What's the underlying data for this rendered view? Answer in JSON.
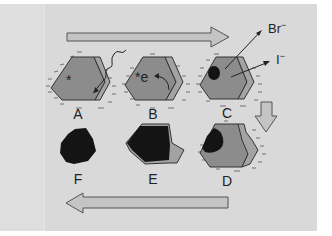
{
  "colors": {
    "background": "#d9d9d9",
    "panel_edge": "#e6e6e6",
    "crystal_face": "#8c8c8c",
    "crystal_side": "#a3a3a3",
    "crystal_stroke": "#333333",
    "arrow_fill": "#c4c4c4",
    "arrow_stroke": "#555555",
    "dark_deposit": "#141414",
    "charge_marks": "#555555"
  },
  "stages": [
    {
      "id": "A",
      "label": "A",
      "marks": [
        "*"
      ],
      "description": "crystal with incoming photon (wavy arrow)"
    },
    {
      "id": "B",
      "label": "B",
      "marks": [
        "*e"
      ],
      "description": "electron released from excited site"
    },
    {
      "id": "C",
      "label": "C",
      "marks": [],
      "description": "dark speck forms, Br- and I- ions leave"
    },
    {
      "id": "D",
      "label": "D",
      "marks": [],
      "description": "partially darkened crystal"
    },
    {
      "id": "E",
      "label": "E",
      "marks": [],
      "description": "mostly dark crystal"
    },
    {
      "id": "F",
      "label": "F",
      "marks": [],
      "description": "fully dark grain"
    }
  ],
  "ions": {
    "bromide": {
      "symbol": "Br",
      "charge": "−"
    },
    "iodide": {
      "symbol": "I",
      "charge": "−"
    }
  },
  "annotations": {
    "excited_site": "*",
    "electron": "e"
  },
  "flow_arrows": [
    {
      "name": "top-right-arrow",
      "direction": "right"
    },
    {
      "name": "down-arrow",
      "direction": "down"
    },
    {
      "name": "bottom-left-arrow",
      "direction": "left"
    }
  ]
}
